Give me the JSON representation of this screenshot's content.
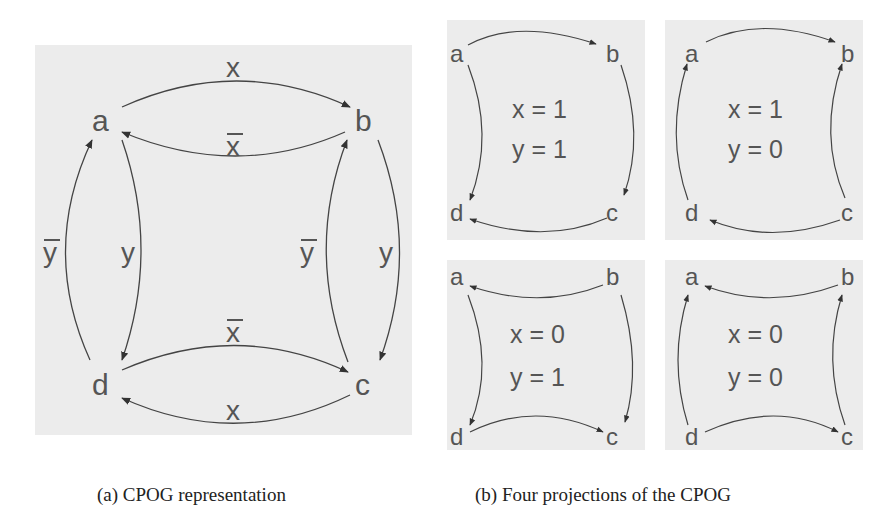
{
  "figure": {
    "panel_a": {
      "caption": "(a) CPOG representation",
      "nodes": [
        "a",
        "b",
        "c",
        "d"
      ],
      "edges": [
        {
          "from": "a",
          "to": "b",
          "label": "x"
        },
        {
          "from": "b",
          "to": "a",
          "label": "x̄"
        },
        {
          "from": "a",
          "to": "d",
          "label": "y"
        },
        {
          "from": "d",
          "to": "a",
          "label": "ȳ"
        },
        {
          "from": "b",
          "to": "c",
          "label": "y"
        },
        {
          "from": "c",
          "to": "b",
          "label": "ȳ"
        },
        {
          "from": "d",
          "to": "c",
          "label": "x̄"
        },
        {
          "from": "c",
          "to": "d",
          "label": "x"
        }
      ],
      "labels": {
        "ab": "x",
        "ba": "x",
        "ad": "y",
        "da": "y",
        "bc": "y",
        "cb": "y",
        "dc": "x",
        "cd": "x"
      }
    },
    "panel_b": {
      "caption": "(b) Four projections of the CPOG",
      "projections": [
        {
          "line1": "x = 1",
          "line2": "y = 1",
          "edges": [
            "a→b",
            "a→d",
            "b→c",
            "c→d"
          ]
        },
        {
          "line1": "x = 1",
          "line2": "y = 0",
          "edges": [
            "a→b",
            "d→a",
            "c→b",
            "c→d"
          ]
        },
        {
          "line1": "x = 0",
          "line2": "y = 1",
          "edges": [
            "b→a",
            "a→d",
            "b→c",
            "d→c"
          ]
        },
        {
          "line1": "x = 0",
          "line2": "y = 0",
          "edges": [
            "b→a",
            "d→a",
            "c→b",
            "d→c"
          ]
        }
      ]
    }
  }
}
